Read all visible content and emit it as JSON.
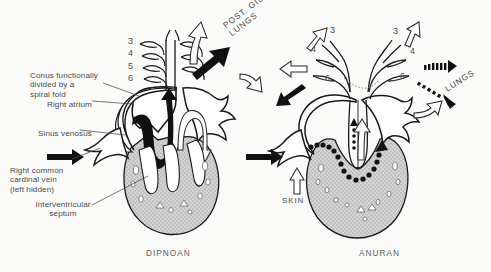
{
  "figure": {
    "background_color": "#fbfbfa",
    "ink_color": "#1a1a1a",
    "ventricle_fill": "#c9c9c9",
    "panels": [
      {
        "id": "dipnoan",
        "caption": "DIPNOAN",
        "arch_numbers": [
          "3",
          "4",
          "5",
          "6"
        ],
        "flow_labels": [
          "POST. GILLS &\nLUNGS"
        ],
        "annotations": [
          {
            "name": "conus",
            "text": "Conus functionally\ndivided by a\nspiral fold"
          },
          {
            "name": "right-atrium",
            "text": "Right atrium"
          },
          {
            "name": "sinus-venosus",
            "text": "Sinus venosus"
          },
          {
            "name": "right-common-cardinal-vein",
            "text": "Right common\ncardinal vein\n(left hidden)"
          },
          {
            "name": "interventricular-septum",
            "text": "Interventricular\nseptum"
          }
        ]
      },
      {
        "id": "anuran",
        "caption": "ANURAN",
        "arch_numbers_left": [
          "3",
          "4",
          "6"
        ],
        "arch_numbers_right": [
          "3",
          "4",
          "6"
        ],
        "flow_labels": [
          "LUNGS",
          "SKIN"
        ],
        "annotations": []
      }
    ],
    "legend_flow": {
      "solid_black_arrow": "deoxygenated blood",
      "open_outline_arrow": "oxygenated blood",
      "beaded_black_arrow": "mixed / deoxygenated blood"
    }
  }
}
